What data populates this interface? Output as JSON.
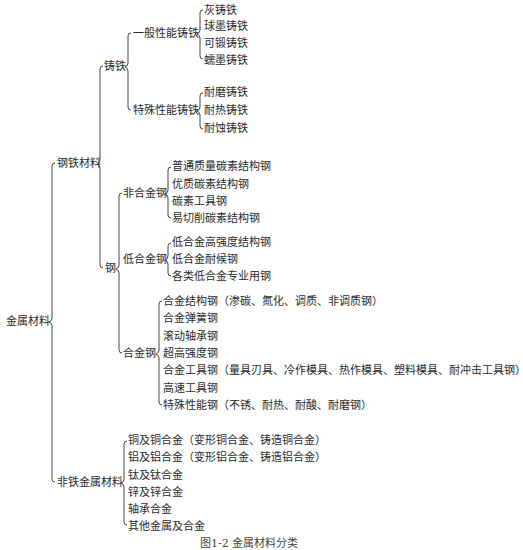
{
  "root": "金属材料",
  "ferrous": {
    "label": "钢铁材料",
    "cast_iron": {
      "label": "铸铁",
      "general": {
        "label": "一般性能铸铁",
        "items": [
          "灰铸铁",
          "球墨铸铁",
          "可锻铸铁",
          "蠕墨铸铁"
        ]
      },
      "special": {
        "label": "特殊性能铸铁",
        "items": [
          "耐磨铸铁",
          "耐热铸铁",
          "耐蚀铸铁"
        ]
      }
    },
    "steel": {
      "label": "钢",
      "non_alloy": {
        "label": "非合金钢",
        "items": [
          "普通质量碳素结构钢",
          "优质碳素结构钢",
          "碳素工具钢",
          "易切削碳素结构钢"
        ]
      },
      "low_alloy": {
        "label": "低合金钢",
        "items": [
          "低合金高强度结构钢",
          "低合金耐候钢",
          "各类低合金专业用钢"
        ]
      },
      "alloy": {
        "label": "合金钢",
        "items": [
          "合金结构钢（渗碳、氮化、调质、非调质钢）",
          "合金弹簧钢",
          "滚动轴承钢",
          "超高强度钢",
          "合金工具钢（量具刃具、冷作模具、热作模具、塑料模具、耐冲击工具钢）",
          "高速工具钢",
          "特殊性能钢（不锈、耐热、耐酸、耐磨钢）"
        ]
      }
    }
  },
  "nonferrous": {
    "label": "非铁金属材料",
    "items": [
      "铜及铜合金（变形铜合金、铸造铜合金）",
      "铝及铝合金（变形铝合金、铸造铝合金）",
      "钛及钛合金",
      "锌及锌合金",
      "轴承合金",
      "其他金属及合金"
    ]
  },
  "caption": "图1-2 金属材料分类"
}
